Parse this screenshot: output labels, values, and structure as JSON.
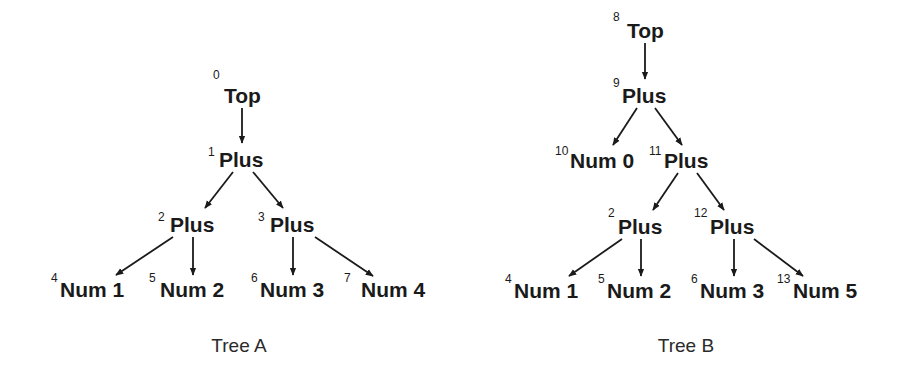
{
  "colors": {
    "ink": "#1a1a1a",
    "background": "#ffffff"
  },
  "trees": [
    {
      "name": "tree-a",
      "caption": "Tree A",
      "caption_pos": [
        239,
        352
      ],
      "nodes": [
        {
          "id": "0",
          "label": "Top",
          "id_pos": [
            213,
            79
          ],
          "label_pos": [
            224,
            103
          ]
        },
        {
          "id": "1",
          "label": "Plus",
          "id_pos": [
            208,
            156
          ],
          "label_pos": [
            219,
            167
          ]
        },
        {
          "id": "2",
          "label": "Plus",
          "id_pos": [
            158,
            221
          ],
          "label_pos": [
            170,
            232
          ]
        },
        {
          "id": "3",
          "label": "Plus",
          "id_pos": [
            258,
            221
          ],
          "label_pos": [
            270,
            232
          ]
        },
        {
          "id": "4",
          "label": "Num 1",
          "id_pos": [
            51,
            282
          ],
          "label_pos": [
            60,
            297
          ]
        },
        {
          "id": "5",
          "label": "Num 2",
          "id_pos": [
            149,
            282
          ],
          "label_pos": [
            160,
            297
          ]
        },
        {
          "id": "6",
          "label": "Num 3",
          "id_pos": [
            251,
            282
          ],
          "label_pos": [
            260,
            297
          ]
        },
        {
          "id": "7",
          "label": "Num 4",
          "id_pos": [
            344,
            282
          ],
          "label_pos": [
            361,
            297
          ]
        }
      ],
      "edges": [
        {
          "from": "0",
          "to": "1",
          "points": [
            242,
            108,
            242,
            143
          ]
        },
        {
          "from": "1",
          "to": "2",
          "points": [
            233,
            172,
            205,
            208
          ]
        },
        {
          "from": "1",
          "to": "3",
          "points": [
            253,
            172,
            283,
            208
          ]
        },
        {
          "from": "2",
          "to": "4",
          "points": [
            173,
            237,
            116,
            275
          ]
        },
        {
          "from": "2",
          "to": "5",
          "points": [
            193,
            237,
            193,
            275
          ]
        },
        {
          "from": "3",
          "to": "6",
          "points": [
            293,
            237,
            293,
            275
          ]
        },
        {
          "from": "3",
          "to": "7",
          "points": [
            315,
            237,
            373,
            276
          ]
        }
      ]
    },
    {
      "name": "tree-b",
      "caption": "Tree B",
      "caption_pos": [
        686,
        352
      ],
      "nodes": [
        {
          "id": "8",
          "label": "Top",
          "id_pos": [
            613,
            21
          ],
          "label_pos": [
            627,
            38
          ]
        },
        {
          "id": "9",
          "label": "Plus",
          "id_pos": [
            613,
            87
          ],
          "label_pos": [
            622,
            103
          ]
        },
        {
          "id": "10",
          "label": "Num 0",
          "id_pos": [
            555,
            155
          ],
          "label_pos": [
            570,
            168
          ]
        },
        {
          "id": "11",
          "label": "Plus",
          "id_pos": [
            649,
            155
          ],
          "label_pos": [
            664,
            168
          ]
        },
        {
          "id": "2",
          "label": "Plus",
          "id_pos": [
            608,
            217
          ],
          "label_pos": [
            618,
            234
          ]
        },
        {
          "id": "12",
          "label": "Plus",
          "id_pos": [
            694,
            217
          ],
          "label_pos": [
            710,
            234
          ]
        },
        {
          "id": "4",
          "label": "Num 1",
          "id_pos": [
            505,
            283
          ],
          "label_pos": [
            514,
            298
          ]
        },
        {
          "id": "5",
          "label": "Num 2",
          "id_pos": [
            598,
            283
          ],
          "label_pos": [
            607,
            298
          ]
        },
        {
          "id": "6",
          "label": "Num 3",
          "id_pos": [
            691,
            283
          ],
          "label_pos": [
            700,
            298
          ]
        },
        {
          "id": "13",
          "label": "Num 5",
          "id_pos": [
            777,
            283
          ],
          "label_pos": [
            793,
            298
          ]
        }
      ],
      "edges": [
        {
          "from": "8",
          "to": "9",
          "points": [
            645,
            43,
            645,
            79
          ]
        },
        {
          "from": "9",
          "to": "10",
          "points": [
            637,
            108,
            613,
            145
          ]
        },
        {
          "from": "9",
          "to": "11",
          "points": [
            655,
            108,
            682,
            145
          ]
        },
        {
          "from": "11",
          "to": "2",
          "points": [
            678,
            173,
            653,
            210
          ]
        },
        {
          "from": "11",
          "to": "12",
          "points": [
            697,
            173,
            724,
            210
          ]
        },
        {
          "from": "2",
          "to": "4",
          "points": [
            622,
            239,
            569,
            276
          ]
        },
        {
          "from": "2",
          "to": "5",
          "points": [
            641,
            239,
            641,
            276
          ]
        },
        {
          "from": "12",
          "to": "6",
          "points": [
            734,
            239,
            734,
            276
          ]
        },
        {
          "from": "12",
          "to": "13",
          "points": [
            754,
            239,
            803,
            276
          ]
        }
      ]
    }
  ]
}
